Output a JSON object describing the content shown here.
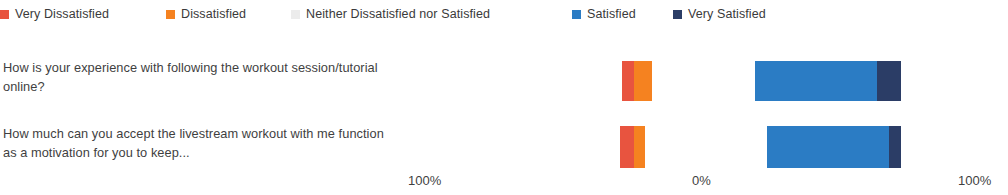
{
  "chart_data": {
    "type": "bar",
    "subtype": "diverging-stacked-likert",
    "title": "",
    "xlabel": "",
    "ylabel": "",
    "grid": false,
    "legend_position": "top",
    "axis_ticks": [
      {
        "label": "100%",
        "x": 408
      },
      {
        "label": "0%",
        "x": 692
      },
      {
        "label": "100%",
        "x": 958
      }
    ],
    "legend": [
      {
        "name": "Very Dissatisfied",
        "color": "#e8543f",
        "x": 0
      },
      {
        "name": "Dissatisfied",
        "color": "#f58220",
        "x": 166
      },
      {
        "name": "Neither Dissatisfied nor Satisfied",
        "color": "#ececec",
        "x": 291
      },
      {
        "name": "Satisfied",
        "color": "#2b7cc4",
        "x": 572
      },
      {
        "name": "Very Satisfied",
        "color": "#2b3d66",
        "x": 673
      }
    ],
    "categories": [
      "How is your experience with following the workout session/tutorial online?",
      "How much can you accept the livestream workout with me function as a motivation for you to keep..."
    ],
    "series": [
      {
        "name": "Very Dissatisfied",
        "color": "#e8543f",
        "values": [
          4.5,
          5.3
        ]
      },
      {
        "name": "Dissatisfied",
        "color": "#f58220",
        "values": [
          6.8,
          4.1
        ]
      },
      {
        "name": "Neither Dissatisfied nor Satisfied",
        "color": "#ececec",
        "values": [
          0,
          0
        ]
      },
      {
        "name": "Satisfied",
        "color": "#2b7cc4",
        "values": [
          45.9,
          45.9
        ]
      },
      {
        "name": "Very Satisfied",
        "color": "#2b3d66",
        "values": [
          9.0,
          4.5
        ]
      }
    ],
    "bars": [
      {
        "category": "How is your experience with following the workout session/tutorial online?",
        "segments": [
          {
            "name": "Very Dissatisfied",
            "color": "#e8543f",
            "x": 622,
            "width": 12
          },
          {
            "name": "Dissatisfied",
            "color": "#f58220",
            "x": 634,
            "width": 18
          },
          {
            "name": "Satisfied",
            "color": "#2b7cc4",
            "x": 755,
            "width": 122
          },
          {
            "name": "Very Satisfied",
            "color": "#2b3d66",
            "x": 877,
            "width": 24
          }
        ]
      },
      {
        "category": "How much can you accept the livestream workout with me function as a motivation for you to keep...",
        "segments": [
          {
            "name": "Very Dissatisfied",
            "color": "#e8543f",
            "x": 620,
            "width": 14
          },
          {
            "name": "Dissatisfied",
            "color": "#f58220",
            "x": 634,
            "width": 11
          },
          {
            "name": "Satisfied",
            "color": "#2b7cc4",
            "x": 767,
            "width": 122
          },
          {
            "name": "Very Satisfied",
            "color": "#2b3d66",
            "x": 889,
            "width": 12
          }
        ]
      }
    ]
  }
}
